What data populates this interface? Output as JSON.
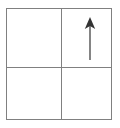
{
  "figure": {
    "title": "",
    "background_color": "#ffffff",
    "line_color": "#808080",
    "arrow_color": "#333333",
    "grid": {
      "name": "2x2-quadrant-square",
      "rows": 2,
      "columns": 2,
      "border_label": "square-outline",
      "vertical_divider_label": "vertical-divider",
      "horizontal_divider_label": "horizontal-divider",
      "cells": [
        {
          "position": "top-left",
          "content": ""
        },
        {
          "position": "top-right",
          "content": "arrow-up"
        },
        {
          "position": "bottom-left",
          "content": ""
        },
        {
          "position": "bottom-right",
          "content": ""
        }
      ]
    },
    "arrow": {
      "label": "arrow-up",
      "direction": "up",
      "color": "#333333",
      "quadrant": "top-right"
    }
  }
}
